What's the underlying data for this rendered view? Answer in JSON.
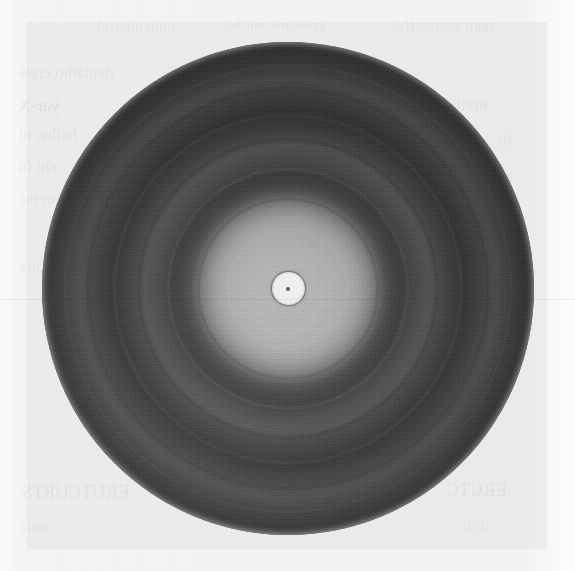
{
  "figure": {
    "kind": "diffraction-photograph",
    "medium": "halftone reproduction on aged book paper",
    "caption": "",
    "label": "",
    "geometry": {
      "image_width_px": 575,
      "image_height_px": 571,
      "disc_center_x_px": 288,
      "disc_center_y_px": 288,
      "disc_radius_px": 246,
      "disc_left_px": 42,
      "disc_top_px": 42,
      "central_halo_radius_px": 58,
      "beam_stop_outer_radius_px": 16,
      "beam_stop_core_radius_px": 2
    },
    "colors": {
      "paper_background": "#f4f4f4",
      "plate_tint": "#e4e4e4",
      "halo_highlight": "#e3e3e3",
      "ring_dark": "#363433",
      "ring_light": "#5f5d5b",
      "disc_rim": "#414040",
      "beam_stop_ring": "#232221",
      "beam_stop_interior": "#efeeec",
      "beam_stop_core": "#4a4846",
      "ghost_text_ink": "#000000"
    }
  },
  "chart_data": {
    "type": "heatmap",
    "title": "",
    "subtitle": "",
    "xlabel": "",
    "ylabel": "",
    "coordinate_system": "polar",
    "radial_axis": {
      "units": "pixels from pattern centre",
      "range": [
        0,
        246
      ]
    },
    "intensity_axis": {
      "units": "relative photographic density (0 = clear film / bright, 1 = fully exposed / dark)",
      "range": [
        0,
        1
      ],
      "note": "dark rings on the print correspond to high diffracted intensity"
    },
    "grid": false,
    "legend": "none",
    "radial_profile": {
      "r_px": [
        0,
        8,
        16,
        24,
        34,
        44,
        54,
        62,
        72,
        82,
        92,
        100,
        110,
        120,
        132,
        142,
        152,
        162,
        172,
        182,
        192,
        200,
        210,
        220,
        230,
        240,
        246
      ],
      "density": [
        0.55,
        0.9,
        0.88,
        0.14,
        0.16,
        0.2,
        0.3,
        0.47,
        0.63,
        0.72,
        0.74,
        0.68,
        0.63,
        0.61,
        0.71,
        0.77,
        0.78,
        0.7,
        0.66,
        0.72,
        0.8,
        0.81,
        0.75,
        0.71,
        0.77,
        0.79,
        0.78
      ],
      "gray_level": [
        116,
        26,
        30,
        227,
        220,
        208,
        176,
        140,
        102,
        78,
        72,
        88,
        98,
        103,
        80,
        64,
        61,
        82,
        92,
        74,
        56,
        54,
        66,
        72,
        58,
        56,
        58
      ]
    },
    "rings": [
      {
        "index": 0,
        "name": "beam stop shadow",
        "radius_px": 16,
        "radial_width_px": 3,
        "kind": "opaque mask",
        "gray_level": 35,
        "relative_intensity": null
      },
      {
        "index": 1,
        "name": "central halo (direct beam halo)",
        "radius_px": 0,
        "radial_width_px": 58,
        "kind": "bright",
        "gray_level": 225,
        "relative_intensity": 1.0
      },
      {
        "index": 2,
        "name": "1st diffraction ring",
        "radius_px": 88,
        "radial_width_px": 26,
        "kind": "dark",
        "gray_level": 72,
        "relative_intensity": 0.74
      },
      {
        "index": 3,
        "name": "1st interring gap",
        "radius_px": 118,
        "radial_width_px": 20,
        "kind": "light",
        "gray_level": 102,
        "relative_intensity": 0.3
      },
      {
        "index": 4,
        "name": "2nd diffraction ring",
        "radius_px": 147,
        "radial_width_px": 24,
        "kind": "dark",
        "gray_level": 62,
        "relative_intensity": 0.62
      },
      {
        "index": 5,
        "name": "2nd interring gap",
        "radius_px": 172,
        "radial_width_px": 16,
        "kind": "light",
        "gray_level": 93,
        "relative_intensity": 0.26
      },
      {
        "index": 6,
        "name": "3rd diffraction ring",
        "radius_px": 198,
        "radial_width_px": 24,
        "kind": "dark",
        "gray_level": 55,
        "relative_intensity": 0.55
      },
      {
        "index": 7,
        "name": "outer halation / film edge",
        "radius_px": 234,
        "radial_width_px": 24,
        "kind": "dark",
        "gray_level": 58,
        "relative_intensity": 0.4
      }
    ],
    "annotations": []
  },
  "ghost_text": {
    "note": "Faint mirrored show-through of printing on the reverse of the page; only partially legible.",
    "lines": [
      {
        "id": "gt-1",
        "text": "noitcudortnI",
        "x": 96,
        "y": 18,
        "size": 15,
        "class": "ghost dimmer"
      },
      {
        "id": "gt-2",
        "text": "erutcurts eht fo",
        "x": 228,
        "y": 16,
        "size": 15,
        "class": "ghost dimmer"
      },
      {
        "id": "gt-3",
        "text": "sgnir noitcarffid",
        "x": 392,
        "y": 17,
        "size": 15,
        "class": "ghost dimmer"
      },
      {
        "id": "gt-4",
        "text": "deniatbo erew",
        "x": 18,
        "y": 64,
        "size": 16,
        "class": "ghost dim"
      },
      {
        "id": "gt-5",
        "text": "yar-X",
        "x": 18,
        "y": 96,
        "size": 17,
        "class": "ghost"
      },
      {
        "id": "gt-6",
        "text": "hcihw ni",
        "x": 18,
        "y": 126,
        "size": 16,
        "class": "ghost dim"
      },
      {
        "id": "gt-7",
        "text": "eht fo",
        "x": 18,
        "y": 158,
        "size": 16,
        "class": "ghost dim"
      },
      {
        "id": "gt-8",
        "text": "-retni",
        "x": 20,
        "y": 190,
        "size": 16,
        "class": "ghost dimmer"
      },
      {
        "id": "gt-9",
        "text": "sisylana",
        "x": 20,
        "y": 258,
        "size": 16,
        "class": "ghost dimmer"
      },
      {
        "id": "gt-10",
        "text": "nrettap",
        "x": 440,
        "y": 96,
        "size": 16,
        "class": "ghost dim"
      },
      {
        "id": "gt-11",
        "text": "fo",
        "x": 498,
        "y": 132,
        "size": 16,
        "class": "ghost dimmer"
      },
      {
        "id": "gt-12",
        "text": "eht",
        "x": 492,
        "y": 168,
        "size": 16,
        "class": "ghost dimmer"
      },
      {
        "id": "gt-13",
        "text": "gnir",
        "x": 492,
        "y": 212,
        "size": 16,
        "class": "ghost dimmer"
      },
      {
        "id": "gt-14",
        "text": "ERUTCURTS",
        "x": 22,
        "y": 482,
        "size": 18,
        "class": "ghost dim"
      },
      {
        "id": "gt-15",
        "text": "-noit",
        "x": 22,
        "y": 518,
        "size": 16,
        "class": "ghost dimmer"
      },
      {
        "id": "gt-16",
        "text": "ERUTC",
        "x": 446,
        "y": 480,
        "size": 18,
        "class": "ghost dim"
      },
      {
        "id": "gt-17",
        "text": "noit",
        "x": 462,
        "y": 516,
        "size": 16,
        "class": "ghost dimmer"
      }
    ]
  },
  "ring_edges": [
    {
      "id": "edge-1",
      "diameter_pct": 24.0,
      "color": "rgba(255,255,255,0.10)",
      "width_px": 2
    },
    {
      "id": "edge-2",
      "diameter_pct": 35.8,
      "color": "rgba(0,0,0,0.10)",
      "width_px": 3
    },
    {
      "id": "edge-3",
      "diameter_pct": 48.0,
      "color": "rgba(255,255,255,0.055)",
      "width_px": 3
    },
    {
      "id": "edge-4",
      "diameter_pct": 59.8,
      "color": "rgba(0,0,0,0.085)",
      "width_px": 4
    },
    {
      "id": "edge-5",
      "diameter_pct": 70.0,
      "color": "rgba(255,255,255,0.045)",
      "width_px": 3
    },
    {
      "id": "edge-6",
      "diameter_pct": 80.5,
      "color": "rgba(0,0,0,0.075)",
      "width_px": 4
    },
    {
      "id": "edge-7",
      "diameter_pct": 90.0,
      "color": "rgba(255,255,255,0.035)",
      "width_px": 3
    }
  ]
}
